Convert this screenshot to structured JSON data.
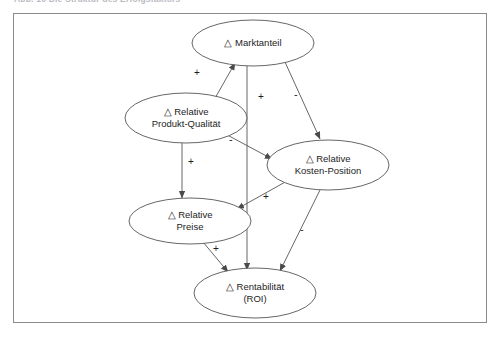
{
  "caption": {
    "text": "Abb. 10    Die Struktur des Erfolgsfaktors"
  },
  "figure": {
    "frame_color": "#8a8a8a",
    "background": "#ffffff",
    "line_color": "#555555",
    "text_color": "#1d1d1d"
  },
  "diagram": {
    "type": "influence-diagram",
    "language": "de",
    "delta_symbol": "△",
    "nodes": [
      {
        "id": "marktanteil",
        "line1": "△ Marktanteil",
        "line2": "",
        "cx": 253,
        "cy": 43,
        "rx": 61,
        "ry": 23
      },
      {
        "id": "produkt-qualitaet",
        "line1": "△ Relative",
        "line2": "Produkt-Qualität",
        "cx": 186,
        "cy": 118,
        "rx": 61,
        "ry": 25
      },
      {
        "id": "kosten-position",
        "line1": "△ Relative",
        "line2": "Kosten-Position",
        "cx": 328,
        "cy": 165,
        "rx": 61,
        "ry": 25
      },
      {
        "id": "preise",
        "line1": "△ Relative",
        "line2": "Preise",
        "cx": 190,
        "cy": 221,
        "rx": 61,
        "ry": 23
      },
      {
        "id": "rentabilitaet",
        "line1": "△ Rentabilität",
        "line2": "(ROI)",
        "cx": 255,
        "cy": 293,
        "rx": 61,
        "ry": 25
      }
    ],
    "edges": [
      {
        "id": "qualitaet-to-marktanteil",
        "from": "produkt-qualitaet",
        "to": "marktanteil",
        "sign": "+",
        "sign_x": 194,
        "sign_y": 73
      },
      {
        "id": "marktanteil-to-rentabilitaet",
        "from": "marktanteil",
        "to": "rentabilitaet",
        "sign": "+",
        "sign_x": 258,
        "sign_y": 97
      },
      {
        "id": "marktanteil-to-kosten",
        "from": "marktanteil",
        "to": "kosten-position",
        "sign": "-",
        "sign_x": 294,
        "sign_y": 95
      },
      {
        "id": "qualitaet-to-kosten",
        "from": "produkt-qualitaet",
        "to": "kosten-position",
        "sign": "-",
        "sign_x": 229,
        "sign_y": 140
      },
      {
        "id": "qualitaet-to-preise",
        "from": "produkt-qualitaet",
        "to": "preise",
        "sign": "+",
        "sign_x": 190,
        "sign_y": 163
      },
      {
        "id": "kosten-to-preise",
        "from": "kosten-position",
        "to": "preise",
        "sign": "+",
        "sign_x": 265,
        "sign_y": 197
      },
      {
        "id": "preise-to-rentabilitaet",
        "from": "preise",
        "to": "rentabilitaet",
        "sign": "+",
        "sign_x": 215,
        "sign_y": 249
      },
      {
        "id": "kosten-to-rentabilitaet",
        "from": "kosten-position",
        "to": "rentabilitaet",
        "sign": "-",
        "sign_x": 301,
        "sign_y": 229
      }
    ]
  }
}
